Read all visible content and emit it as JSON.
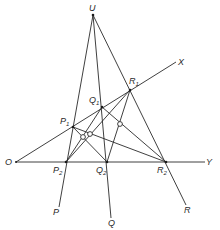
{
  "diagram": {
    "type": "projective-geometry-construction",
    "points": {
      "U": {
        "label": "U",
        "x": 93,
        "y": 15
      },
      "O": {
        "label": "O",
        "x": 16,
        "y": 162
      },
      "X": {
        "label": "X",
        "x": 176,
        "y": 62
      },
      "Y": {
        "label": "Y",
        "x": 205,
        "y": 162
      },
      "P1": {
        "label": "P",
        "sub": "1",
        "x": 73,
        "y": 127
      },
      "Q1": {
        "label": "Q",
        "sub": "1",
        "x": 102,
        "y": 107
      },
      "R1": {
        "label": "R",
        "sub": "1",
        "x": 130,
        "y": 90
      },
      "P2": {
        "label": "P",
        "sub": "2",
        "x": 66,
        "y": 162
      },
      "Q2": {
        "label": "Q",
        "sub": "2",
        "x": 107,
        "y": 162
      },
      "R2": {
        "label": "R",
        "sub": "2",
        "x": 166,
        "y": 162
      },
      "P": {
        "label": "P",
        "x": 59,
        "y": 207
      },
      "Q": {
        "label": "Q",
        "x": 111,
        "y": 218
      },
      "R": {
        "label": "R",
        "x": 186,
        "y": 205
      }
    },
    "labels": {
      "U": "U",
      "X": "X",
      "Y": "Y",
      "O": "O",
      "P": "P",
      "Q": "Q",
      "R": "R",
      "P1_main": "P",
      "P1_sub": "1",
      "Q1_main": "Q",
      "Q1_sub": "1",
      "R1_main": "R",
      "R1_sub": "1",
      "P2_main": "P",
      "P2_sub": "2",
      "Q2_main": "Q",
      "Q2_sub": "2",
      "R2_main": "R",
      "R2_sub": "2"
    },
    "lines": [
      {
        "name": "line-OX",
        "from": "O",
        "to": "X"
      },
      {
        "name": "line-OY",
        "from": "O",
        "to": "Y"
      },
      {
        "name": "line-UP",
        "from": "U",
        "to": "P"
      },
      {
        "name": "line-UQ",
        "from": "U",
        "to": "Q"
      },
      {
        "name": "line-UR",
        "from": "U",
        "to": "R"
      },
      {
        "name": "line-P1Q2",
        "from": "P1",
        "to": "Q2"
      },
      {
        "name": "line-P1R2",
        "from": "P1",
        "to": "R2"
      },
      {
        "name": "line-Q1P2",
        "from": "Q1",
        "to": "P2"
      },
      {
        "name": "line-Q1R2",
        "from": "Q1",
        "to": "R2"
      },
      {
        "name": "line-R1P2",
        "from": "R1",
        "to": "P2"
      },
      {
        "name": "line-R1Q2",
        "from": "R1",
        "to": "Q2"
      }
    ],
    "cross_points": [
      {
        "name": "cross-P1Q2-Q1P2",
        "x": 81,
        "y": 136
      },
      {
        "name": "cross-P1R2-R1P2",
        "x": 89,
        "y": 133
      },
      {
        "name": "cross-Q1R2-R1Q2",
        "x": 119,
        "y": 124
      }
    ]
  }
}
